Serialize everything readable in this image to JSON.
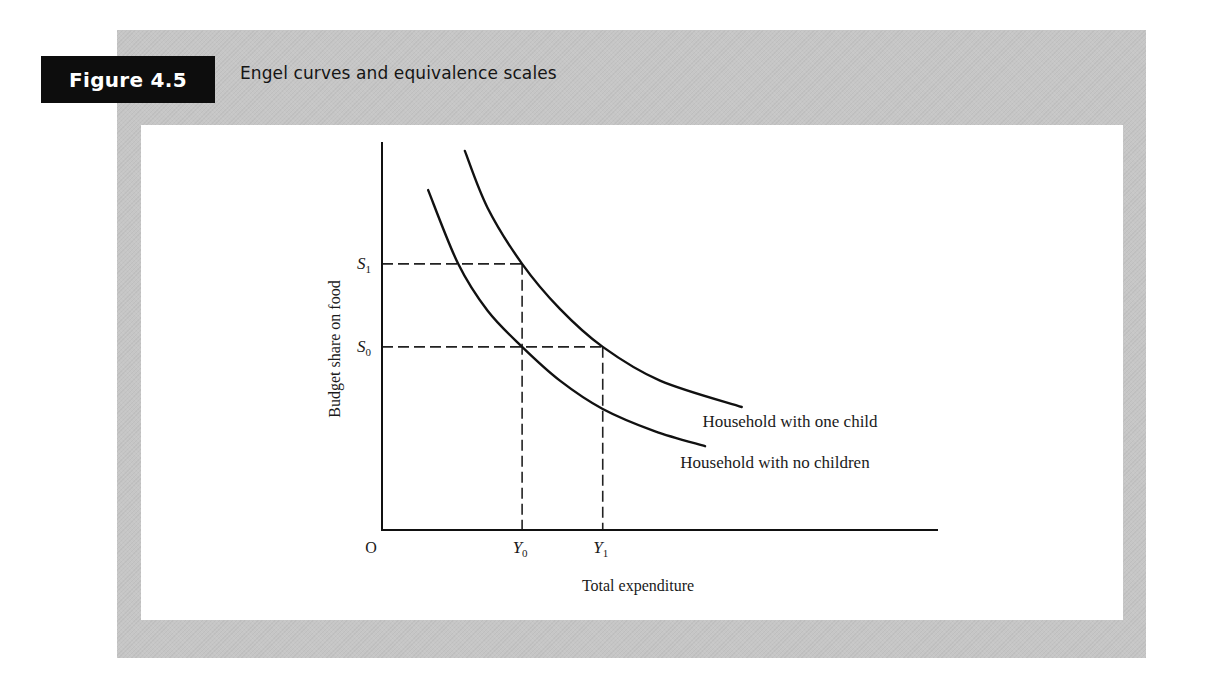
{
  "figure": {
    "label": "Figure 4.5",
    "title": "Engel curves and equivalence scales"
  },
  "chart_data": {
    "type": "line",
    "title": "Engel curves and equivalence scales",
    "xlabel": "Total expenditure",
    "ylabel": "Budget share on food",
    "origin_label": "O",
    "xlim": [
      0,
      10
    ],
    "ylim": [
      0,
      10
    ],
    "grid": false,
    "x_ticks": [
      {
        "label": "Y",
        "sub": "0",
        "value": 2.52
      },
      {
        "label": "Y",
        "sub": "1",
        "value": 3.97
      }
    ],
    "y_ticks": [
      {
        "label": "S",
        "sub": "1",
        "value": 6.86
      },
      {
        "label": "S",
        "sub": "0",
        "value": 4.72
      }
    ],
    "series": [
      {
        "name": "Household with one child",
        "x": [
          1.49,
          1.9,
          2.52,
          3.2,
          3.97,
          5.0,
          6.47
        ],
        "y": [
          9.77,
          8.3,
          6.86,
          5.7,
          4.72,
          3.85,
          3.17
        ]
      },
      {
        "name": "Household with no children",
        "x": [
          0.83,
          1.37,
          1.9,
          2.52,
          3.2,
          3.97,
          4.9,
          5.81
        ],
        "y": [
          8.76,
          6.86,
          5.65,
          4.72,
          3.85,
          3.12,
          2.55,
          2.16
        ]
      }
    ],
    "reference_lines": [
      {
        "from": [
          0,
          6.86
        ],
        "to": [
          2.52,
          6.86
        ],
        "style": "dashed"
      },
      {
        "from": [
          2.52,
          6.86
        ],
        "to": [
          2.52,
          0
        ],
        "style": "dashed"
      },
      {
        "from": [
          0,
          4.72
        ],
        "to": [
          3.97,
          4.72
        ],
        "style": "dashed"
      },
      {
        "from": [
          3.97,
          4.72
        ],
        "to": [
          3.97,
          0
        ],
        "style": "dashed"
      }
    ],
    "legend": "inline-right-of-curves"
  }
}
